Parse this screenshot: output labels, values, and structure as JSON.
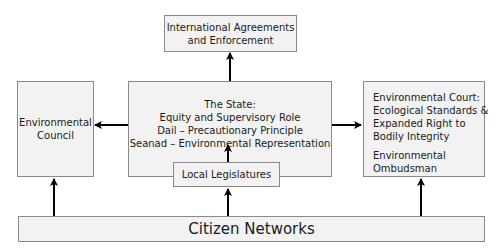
{
  "diagram": {
    "nodes": {
      "international": {
        "lines": [
          "International Agreements",
          "and Enforcement"
        ]
      },
      "council": {
        "lines": [
          "Environmental",
          "Council"
        ]
      },
      "state": {
        "lines": [
          "The State:",
          "Equity and Supervisory Role",
          "Dail – Precautionary Principle",
          "Seanad – Environmental Representation"
        ]
      },
      "local": {
        "label": "Local Legislatures"
      },
      "court": {
        "lines": [
          "Environmental Court:",
          "Ecological Standards &",
          "Expanded Right to",
          "Bodily Integrity"
        ],
        "ombudsman_lines": [
          "Environmental",
          "Ombudsman"
        ]
      },
      "citizen": {
        "label": "Citizen Networks"
      }
    },
    "edges": [
      {
        "from": "state",
        "to": "international"
      },
      {
        "from": "state",
        "to": "council"
      },
      {
        "from": "state",
        "to": "court"
      },
      {
        "from": "local",
        "to": "state"
      },
      {
        "from": "citizen",
        "to": "council"
      },
      {
        "from": "citizen",
        "to": "local"
      },
      {
        "from": "citizen",
        "to": "court"
      }
    ],
    "colors": {
      "box_fill": "#f2f2f2",
      "box_border": "#8a8a8a",
      "arrow": "#000000"
    }
  }
}
